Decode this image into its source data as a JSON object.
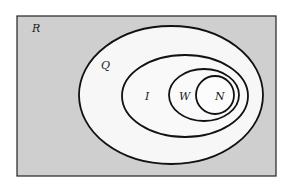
{
  "diagram": {
    "type": "venn-nested",
    "universe": {
      "label": "R",
      "fill": "#cfcfcf"
    },
    "sets": [
      {
        "label": "Q",
        "contains": [
          "I"
        ]
      },
      {
        "label": "I",
        "contains": [
          "W"
        ]
      },
      {
        "label": "W",
        "contains": [
          "N"
        ]
      },
      {
        "label": "N",
        "contains": []
      }
    ],
    "colors": {
      "inner_fill": "#f7f7f7",
      "stroke": "#111111",
      "background": "#ffffff"
    }
  }
}
